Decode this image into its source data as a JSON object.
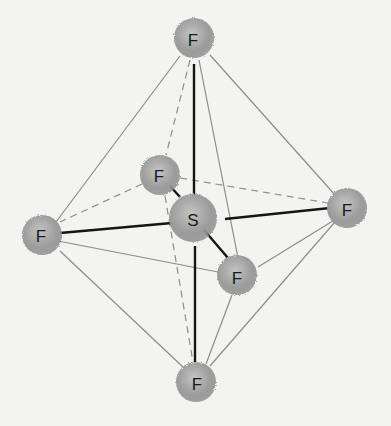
{
  "diagram": {
    "title": "",
    "molecule": "SF6",
    "geometry": "octahedral",
    "atoms": [
      {
        "id": "F_top",
        "label": "F",
        "x": 194,
        "y": 38
      },
      {
        "id": "F_back",
        "label": "F",
        "x": 160,
        "y": 175
      },
      {
        "id": "S",
        "label": "S",
        "x": 193,
        "y": 218
      },
      {
        "id": "F_left",
        "label": "F",
        "x": 42,
        "y": 235
      },
      {
        "id": "F_right",
        "label": "F",
        "x": 347,
        "y": 208
      },
      {
        "id": "F_front",
        "label": "F",
        "x": 237,
        "y": 275
      },
      {
        "id": "F_bottom",
        "label": "F",
        "x": 196,
        "y": 382
      }
    ],
    "colors": {
      "atom": "#9a9a9a",
      "bond": "#151515",
      "edge": "#8a8a8a"
    }
  }
}
